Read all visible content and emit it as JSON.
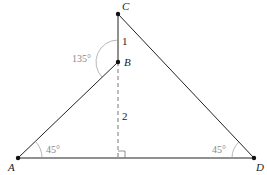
{
  "diagram": {
    "points": {
      "A": {
        "label": "A",
        "x": 18,
        "y": 158
      },
      "B": {
        "label": "B",
        "x": 118,
        "y": 62
      },
      "C": {
        "label": "C",
        "x": 118,
        "y": 14
      },
      "D": {
        "label": "D",
        "x": 254,
        "y": 158
      }
    },
    "segment_labels": {
      "CB": "1",
      "B_foot": "2"
    },
    "angles": {
      "at_A": "45°",
      "at_D": "45°",
      "at_B": "135°"
    },
    "colors": {
      "line": "#222222",
      "arc": "#999999",
      "angle_text": "#888888"
    }
  }
}
